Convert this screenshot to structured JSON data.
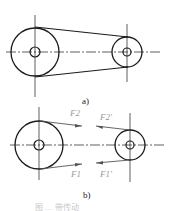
{
  "figure": {
    "panel_a": {
      "label": "a)",
      "large_pulley": {
        "cx": 35,
        "cy": 52,
        "r": 24,
        "hub_r": 5
      },
      "small_pulley": {
        "cx": 127,
        "cy": 52,
        "r": 15,
        "hub_r": 4
      }
    },
    "panel_b": {
      "label": "b)",
      "large_pulley": {
        "cx": 39,
        "cy": 145,
        "r": 24,
        "hub_r": 5
      },
      "small_pulley": {
        "cx": 130,
        "cy": 145,
        "r": 15,
        "hub_r": 4
      },
      "forces": {
        "upper_left": "F2",
        "upper_right": "F2'",
        "lower_left": "F1",
        "lower_right": "F1'"
      }
    },
    "caption": "图 … 带传动"
  },
  "colors": {
    "line": "#1a1a1a",
    "force_label": "#9a9a9a"
  }
}
